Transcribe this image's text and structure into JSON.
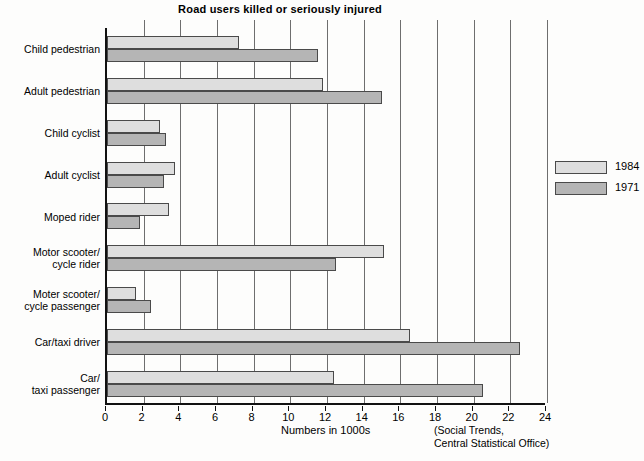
{
  "chart_data": {
    "type": "bar",
    "orientation": "horizontal",
    "title": "Road users killed or seriously injured",
    "xlabel": "Numbers in 1000s",
    "ylabel": "",
    "xlim": [
      0,
      24
    ],
    "xticks": [
      0,
      2,
      4,
      6,
      8,
      10,
      12,
      14,
      16,
      18,
      20,
      22,
      24
    ],
    "grid": true,
    "grid_axis": "x",
    "legend_position": "upper right inside plot",
    "source_note": "(Social Trends,\nCentral Statistical Office)",
    "categories": [
      "Child pedestrian",
      "Adult pedestrian",
      "Child cyclist",
      "Adult cyclist",
      "Moped rider",
      "Motor scooter/\ncycle rider",
      "Moter scooter/\ncycle passenger",
      "Car/taxi driver",
      "Car/\ntaxi passenger"
    ],
    "series": [
      {
        "name": "1984",
        "color": "#dedede",
        "values": [
          7.2,
          11.8,
          2.9,
          3.7,
          3.4,
          15.1,
          1.6,
          16.5,
          12.4
        ]
      },
      {
        "name": "1971",
        "color": "#b5b5b5",
        "values": [
          11.5,
          15.0,
          3.2,
          3.1,
          1.8,
          12.5,
          2.4,
          22.5,
          20.5
        ]
      }
    ]
  },
  "labels": {
    "title": "Road users killed or seriously injured",
    "axis_title": "Numbers in 1000s",
    "source_line1": "(Social Trends,",
    "source_line2": "Central Statistical Office)",
    "categories_display": [
      [
        "Child pedestrian"
      ],
      [
        "Adult pedestrian"
      ],
      [
        "Child cyclist"
      ],
      [
        "Adult cyclist"
      ],
      [
        "Moped rider"
      ],
      [
        "Motor scooter/",
        "cycle rider"
      ],
      [
        "Moter scooter/",
        "cycle passenger"
      ],
      [
        "Car/taxi driver"
      ],
      [
        "Car/",
        "taxi passenger"
      ]
    ]
  },
  "legend": {
    "items": [
      {
        "label": "1984",
        "color": "#dedede"
      },
      {
        "label": "1971",
        "color": "#b5b5b5"
      }
    ]
  },
  "colors": {
    "series_1984": "#dedede",
    "series_1971": "#b5b5b5",
    "axis": "#111111",
    "gridline": "#6e6e6e",
    "background": "#fdfdfc"
  }
}
